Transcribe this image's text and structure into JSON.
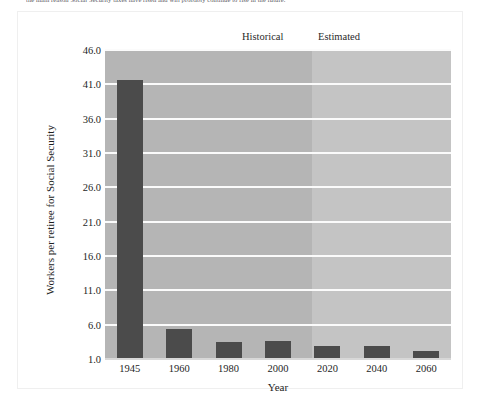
{
  "caption": {
    "text": "the main reason Social Security taxes have risen and will probably continue to rise in the future."
  },
  "chart_data": {
    "type": "bar",
    "title": "",
    "subtitle": "",
    "categories": [
      "1945",
      "1960",
      "1980",
      "2000",
      "2020",
      "2040",
      "2060"
    ],
    "values": [
      41.7,
      5.3,
      3.5,
      3.6,
      2.9,
      2.9,
      2.1
    ],
    "series": [
      {
        "name": "Workers per retiree for Social Security",
        "values": [
          41.7,
          5.3,
          3.5,
          3.6,
          2.9,
          2.9,
          2.1
        ]
      }
    ],
    "xlabel": "Year",
    "ylabel": "Workers per retiree for Social Security",
    "ylim": [
      1.0,
      46.0
    ],
    "ytick_labels": [
      "46.0",
      "41.0",
      "36.0",
      "31.0",
      "26.0",
      "21.0",
      "16.0",
      "11.0",
      "6.0",
      "1.0"
    ],
    "ytick_values": [
      46.0,
      41.0,
      36.0,
      31.0,
      26.0,
      21.0,
      16.0,
      11.0,
      6.0,
      1.0
    ],
    "xtick_labels": [
      "1945",
      "1960",
      "1980",
      "2000",
      "2020",
      "2040",
      "2060"
    ],
    "grid": true,
    "grid_color": "#fbfbfb",
    "legend_position": "above-plot",
    "bands": [
      {
        "label": "Historical",
        "start_category": "1945",
        "end_category": "2000",
        "color": "#b5b5b5"
      },
      {
        "label": "Estimated",
        "start_category": "2020",
        "end_category": "2060",
        "color": "#c4c4c4"
      }
    ],
    "bar_color": "#4b4b4b",
    "plot_background": "#b5b5b5"
  },
  "colors": {
    "bar": "#4b4b4b",
    "band_historical": "#b5b5b5",
    "band_estimated": "#c4c4c4",
    "gridline": "#fbfbfb",
    "axis_text": "#1e1e1e",
    "frame": "#efefef"
  }
}
